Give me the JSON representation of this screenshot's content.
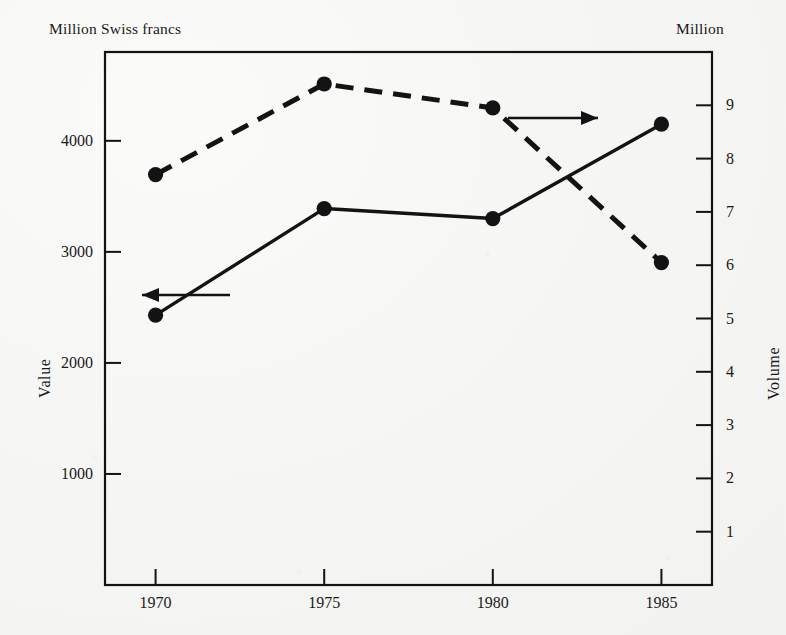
{
  "figure": {
    "left_unit_label": "Million Swiss francs",
    "right_unit_label": "Million",
    "left_axis_title": "Value",
    "right_axis_title": "Volume",
    "ink_color": "#131313",
    "paper_color": "#f4f4f2"
  },
  "annotations": [
    {
      "name": "arrow-to-left-axis",
      "label": "←",
      "points_to": "left"
    },
    {
      "name": "arrow-to-right-axis",
      "label": "→",
      "points_to": "right"
    }
  ],
  "chart_data": {
    "type": "line",
    "title": "",
    "xlabel": "",
    "x": [
      1970,
      1975,
      1980,
      1985
    ],
    "xtick_labels": [
      "1970",
      "1975",
      "1980",
      "1985"
    ],
    "xlim": [
      1968.5,
      1986.5
    ],
    "grid": false,
    "legend": "none",
    "series": [
      {
        "name": "Value",
        "axis": "left",
        "style": "solid",
        "marker": "filled-circle",
        "unit": "Million Swiss francs",
        "values": [
          2430,
          3390,
          3300,
          4150
        ]
      },
      {
        "name": "Volume",
        "axis": "right",
        "style": "dashed",
        "marker": "filled-circle",
        "unit": "Million",
        "values": [
          7.7,
          9.4,
          8.95,
          6.05
        ]
      }
    ],
    "left_axis": {
      "label": "Value",
      "unit_label": "Million Swiss francs",
      "ticks": [
        1000,
        2000,
        3000,
        4000
      ],
      "tick_labels": [
        "1000",
        "2000",
        "3000",
        "4000"
      ],
      "ylim": [
        0,
        4800
      ]
    },
    "right_axis": {
      "label": "Volume",
      "unit_label": "Million",
      "ticks": [
        1,
        2,
        3,
        4,
        5,
        6,
        7,
        8,
        9
      ],
      "tick_labels": [
        "1",
        "2",
        "3",
        "4",
        "5",
        "6",
        "7",
        "8",
        "9"
      ],
      "ylim": [
        0,
        10.0
      ]
    }
  }
}
